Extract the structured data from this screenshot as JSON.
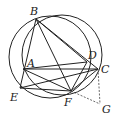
{
  "diagram": {
    "type": "geometry",
    "points": {
      "A": {
        "label": "A",
        "x": 23,
        "y": 69
      },
      "B": {
        "label": "B",
        "x": 36,
        "y": 19
      },
      "C": {
        "label": "C",
        "x": 98,
        "y": 69
      },
      "D": {
        "label": "D",
        "x": 87,
        "y": 62
      },
      "E": {
        "label": "E",
        "x": 20,
        "y": 88
      },
      "F": {
        "label": "F",
        "x": 71,
        "y": 91
      },
      "G": {
        "label": "G",
        "x": 100,
        "y": 104
      }
    },
    "circles": [
      {
        "name": "circle-1",
        "cx": 52,
        "cy": 56,
        "r": 40
      },
      {
        "name": "circle-2",
        "cx": 61,
        "cy": 55,
        "r": 41
      }
    ],
    "solid_segments": [
      "AC",
      "BE",
      "BF",
      "BC",
      "BD",
      "AF",
      "AD",
      "EC",
      "EF",
      "FC",
      "DF"
    ],
    "dashed_segments": [
      "CG",
      "FG"
    ]
  }
}
